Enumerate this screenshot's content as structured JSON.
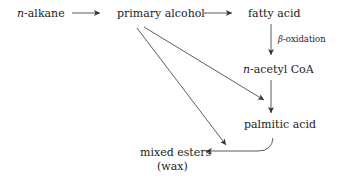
{
  "diagram": {
    "nodes": {
      "n_alkane": {
        "prefix": "n",
        "text": "-alkane"
      },
      "primary_alcohol": {
        "text": "primary alcohol"
      },
      "fatty_acid": {
        "text": "fatty acid"
      },
      "n_acetyl_coa": {
        "prefix": "n",
        "text": "-acetyl CoA"
      },
      "palmitic_acid": {
        "text": "palmitic acid"
      },
      "mixed_esters": {
        "line1": "mixed esters",
        "line2": "(wax)"
      }
    },
    "edge_labels": {
      "beta_oxidation": {
        "symbol": "β",
        "text": "-oxidation"
      }
    },
    "edges": [
      {
        "from": "n-alkane",
        "to": "primary alcohol"
      },
      {
        "from": "primary alcohol",
        "to": "fatty acid"
      },
      {
        "from": "fatty acid",
        "to": "n-acetyl CoA",
        "label": "β-oxidation"
      },
      {
        "from": "n-acetyl CoA",
        "to": "palmitic acid"
      },
      {
        "from": "primary alcohol",
        "to": "palmitic acid"
      },
      {
        "from": "primary alcohol",
        "to": "mixed esters (wax)"
      },
      {
        "from": "palmitic acid",
        "to": "mixed esters (wax)"
      }
    ],
    "colors": {
      "ink": "#222222",
      "background": "#ffffff"
    }
  }
}
